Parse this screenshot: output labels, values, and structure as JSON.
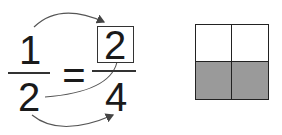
{
  "equation": {
    "left_numerator": "1",
    "left_denominator": "2",
    "equals": "=",
    "right_numerator": "2",
    "right_denominator": "4"
  },
  "model": {
    "rows": 2,
    "cols": 2,
    "shaded_cells": [
      [
        1,
        0
      ],
      [
        1,
        1
      ]
    ],
    "shade_color": "#9a9a9a"
  }
}
